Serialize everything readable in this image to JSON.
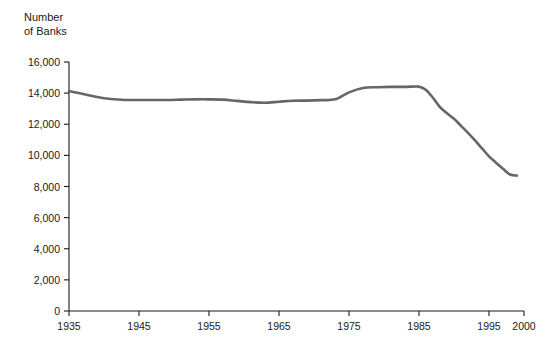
{
  "chart_data": {
    "type": "line",
    "title": "",
    "ylabel": "Number\nof Banks",
    "xlabel": "",
    "ylim": [
      0,
      16000
    ],
    "xlim": [
      1935,
      2000
    ],
    "grid": false,
    "legend": "none",
    "line_color": "#666666",
    "axis_color": "#1a1a1a",
    "y_ticks": [
      0,
      2000,
      4000,
      6000,
      8000,
      10000,
      12000,
      14000,
      16000
    ],
    "y_tick_labels": [
      "0",
      "2,000",
      "4,000",
      "6,000",
      "8,000",
      "10,000",
      "12,000",
      "14,000",
      "16,000"
    ],
    "x_ticks": [
      1935,
      1945,
      1955,
      1965,
      1975,
      1985,
      1995,
      2000
    ],
    "x_tick_labels": [
      "1935",
      "1945",
      "1955",
      "1965",
      "1975",
      "1985",
      "1995",
      "2000"
    ],
    "series": [
      {
        "name": "Number of Banks",
        "x": [
          1935,
          1937,
          1939,
          1941,
          1943,
          1945,
          1947,
          1949,
          1951,
          1953,
          1955,
          1957,
          1959,
          1961,
          1963,
          1965,
          1967,
          1969,
          1971,
          1973,
          1975,
          1977,
          1979,
          1981,
          1983,
          1985,
          1986,
          1987,
          1988,
          1989,
          1990,
          1991,
          1992,
          1993,
          1994,
          1995,
          1996,
          1997,
          1998,
          1999
        ],
        "y": [
          14130,
          13950,
          13750,
          13620,
          13560,
          13560,
          13560,
          13560,
          13580,
          13600,
          13600,
          13580,
          13500,
          13420,
          13380,
          13450,
          13510,
          13520,
          13550,
          13600,
          14050,
          14330,
          14380,
          14400,
          14400,
          14420,
          14200,
          13700,
          13100,
          12700,
          12350,
          11900,
          11450,
          10960,
          10450,
          9940,
          9530,
          9140,
          8770,
          8700
        ]
      }
    ]
  }
}
